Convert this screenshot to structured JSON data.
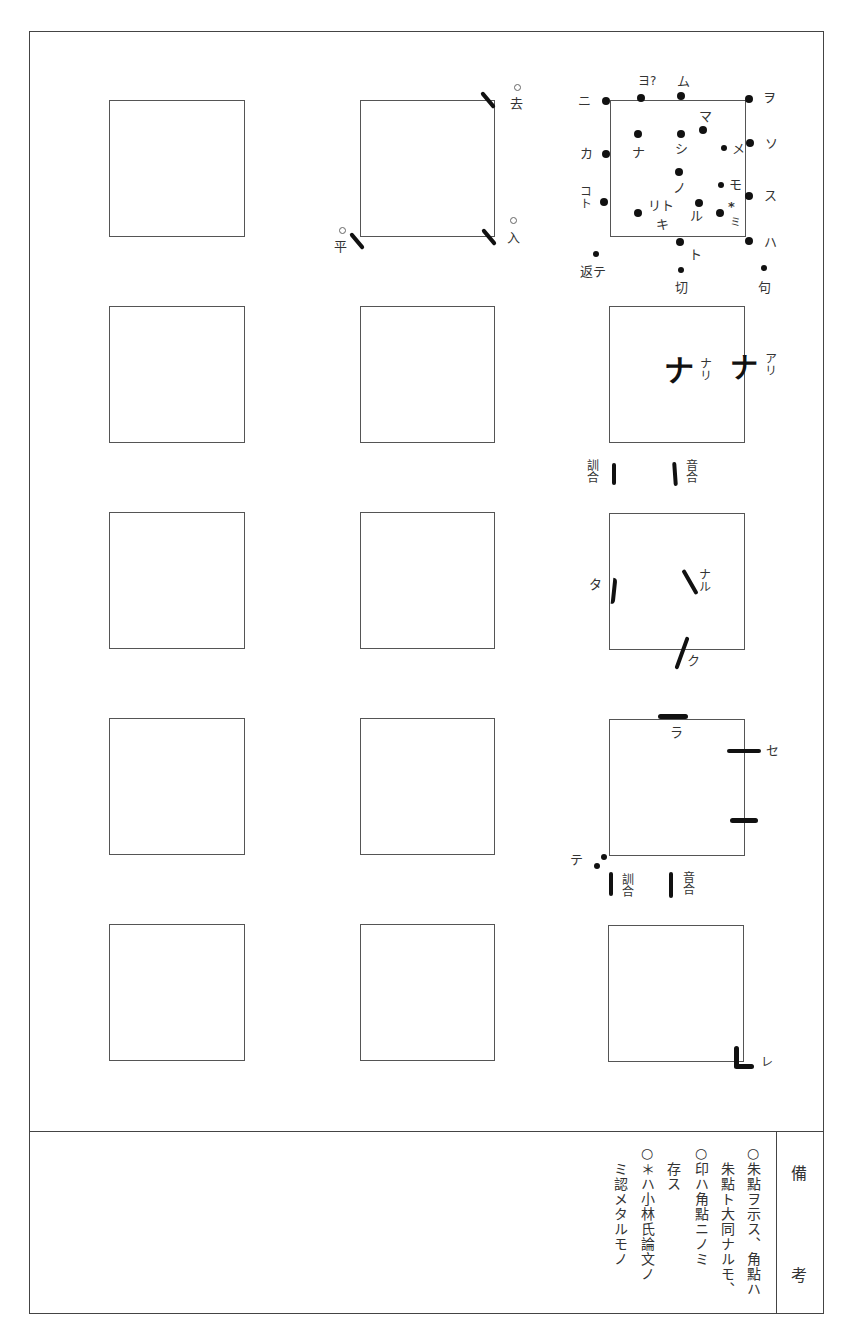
{
  "document": {
    "type": "kunten diagram sheet",
    "grid": {
      "rows": 5,
      "cols": 3
    }
  },
  "tone_marks": {
    "top_right": "去",
    "bottom_left": "平",
    "bottom_right": "入"
  },
  "dot_chart": {
    "outside_left": [
      "ニ",
      "カ",
      "コ",
      "ト"
    ],
    "top": [
      "ヨ?",
      "ム"
    ],
    "inside": [
      "ナ",
      "マ",
      "シ",
      "メ",
      "ノ",
      "モ",
      "リト",
      "キ",
      "ル",
      "*",
      "ミ"
    ],
    "outside_right": [
      "ヲ",
      "ソ",
      "ス",
      "ハ"
    ],
    "bottom": [
      "ト",
      "返テ",
      "切",
      "句"
    ]
  },
  "row2_marks": {
    "nari": "ナリ",
    "ari": "アリ",
    "kun_go": "訓合",
    "on_go": "音合"
  },
  "row3_marks": {
    "ta": "タ",
    "naru": "ナル",
    "ku": "ク"
  },
  "row4_marks": {
    "ra": "ラ",
    "se": "セ",
    "te": "テ",
    "kun_go": "訓合",
    "on_go": "音合"
  },
  "row5_marks": {
    "re": "レ"
  },
  "remarks": {
    "header_top": "備",
    "header_bottom": "考",
    "columns": [
      "○朱點ヲ示ス、角點ハ",
      "朱點ト大同ナルモ、",
      "○印ハ角點ニノミ",
      "存ス",
      "○＊ハ小林氏論文ノ",
      "ミ認メタルモノ"
    ]
  }
}
